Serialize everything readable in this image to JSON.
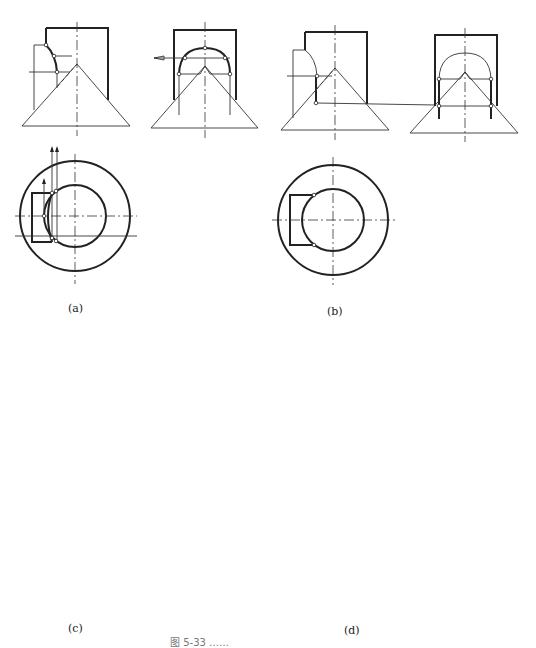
{
  "figure": {
    "caption": "图 5-33 ……",
    "panels": [
      {
        "id": "a",
        "label": "(a)"
      },
      {
        "id": "b",
        "label": "(b)"
      },
      {
        "id": "c",
        "label": "(c)"
      },
      {
        "id": "d",
        "label": "(d)"
      }
    ]
  },
  "colors": {
    "line": "#222222",
    "thin": "#444444",
    "background": "#ffffff"
  }
}
